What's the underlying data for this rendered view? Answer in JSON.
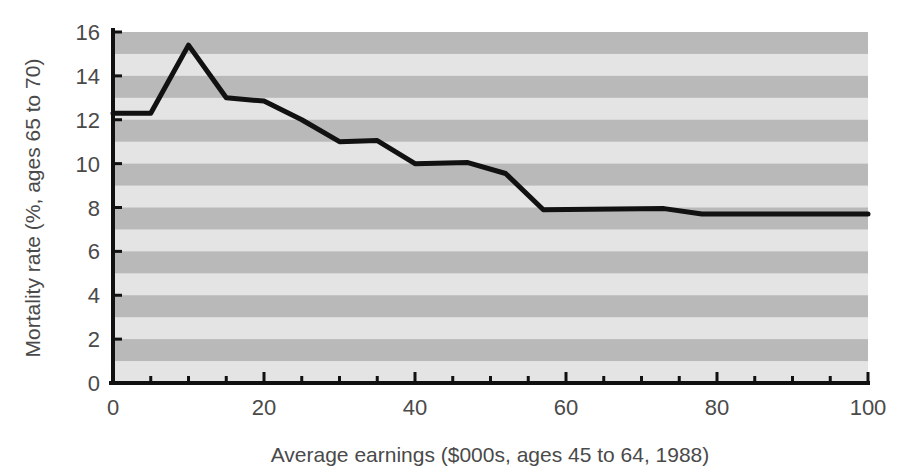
{
  "chart_data": {
    "type": "line",
    "title": "",
    "subtitle": "",
    "xlabel": "Average earnings ($000s, ages 45 to 64, 1988)",
    "ylabel": "Mortality rate (%, ages 65 to 70)",
    "xlim": [
      0,
      100
    ],
    "ylim": [
      0,
      16
    ],
    "xticks": [
      0,
      20,
      40,
      60,
      80,
      100
    ],
    "xtick_labels": [
      "0",
      "20",
      "40",
      "60",
      "80",
      "100"
    ],
    "xminor_step": 5,
    "yticks": [
      0,
      2,
      4,
      6,
      8,
      10,
      12,
      14,
      16
    ],
    "ytick_labels": [
      "0",
      "2",
      "4",
      "6",
      "8",
      "10",
      "12",
      "14",
      "16"
    ],
    "grid": false,
    "banding": {
      "enabled": true,
      "orientation": "horizontal",
      "step": 1,
      "light_color": "#e4e4e4",
      "dark_color": "#b9b9b9",
      "dark_intervals": [
        [
          1,
          2
        ],
        [
          3,
          4
        ],
        [
          5,
          6
        ],
        [
          7,
          8
        ],
        [
          9,
          10
        ],
        [
          11,
          12
        ],
        [
          13,
          14
        ],
        [
          15,
          16
        ]
      ]
    },
    "legend": {
      "visible": false,
      "position": "none"
    },
    "series": [
      {
        "name": "Mortality rate",
        "color": "#111111",
        "line_width": 5,
        "markers": false,
        "x": [
          0,
          5,
          10,
          15,
          20,
          25,
          30,
          35,
          40,
          47,
          52,
          57,
          73,
          78,
          100
        ],
        "values": [
          12.3,
          12.3,
          15.4,
          13.0,
          12.85,
          12.0,
          11.0,
          11.05,
          10.0,
          10.05,
          9.55,
          7.9,
          7.95,
          7.7,
          7.7
        ]
      }
    ]
  },
  "figure": {
    "background_color": "#ffffff",
    "axis_color": "#111111",
    "text_color": "#4a4a4a"
  }
}
